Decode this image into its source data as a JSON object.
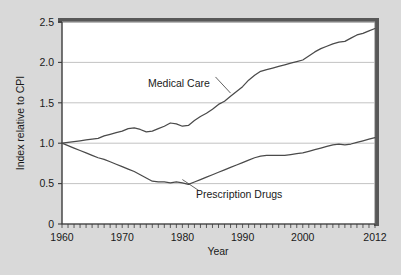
{
  "chart_data": {
    "type": "line",
    "title": "",
    "xlabel": "Year",
    "ylabel": "Index relative to CPI",
    "xlim": [
      1960,
      2012
    ],
    "ylim": [
      0,
      2.5
    ],
    "grid": true,
    "legend_position": "inline-annotations",
    "x_ticks": [
      1960,
      1970,
      1980,
      1990,
      2000,
      2012
    ],
    "x_tick_labels": [
      "1960",
      "1970",
      "1980",
      "1990",
      "2000",
      "2012"
    ],
    "x_minor_tick_interval": 1,
    "y_ticks": [
      0,
      0.5,
      1.0,
      1.5,
      2.0,
      2.5
    ],
    "y_tick_labels": [
      "0",
      "0.5",
      "1.0",
      "1.5",
      "2.0",
      "2.5"
    ],
    "x": [
      1960,
      1961,
      1962,
      1963,
      1964,
      1965,
      1966,
      1967,
      1968,
      1969,
      1970,
      1971,
      1972,
      1973,
      1974,
      1975,
      1976,
      1977,
      1978,
      1979,
      1980,
      1981,
      1982,
      1983,
      1984,
      1985,
      1986,
      1987,
      1988,
      1989,
      1990,
      1991,
      1992,
      1993,
      1994,
      1995,
      1996,
      1997,
      1998,
      1999,
      2000,
      2001,
      2002,
      2003,
      2004,
      2005,
      2006,
      2007,
      2008,
      2009,
      2010,
      2011,
      2012
    ],
    "series": [
      {
        "name": "Medical Care",
        "color": "#4a4a4a",
        "label_x": 1979,
        "label_y": 1.86,
        "values": [
          1.0,
          1.01,
          1.02,
          1.03,
          1.04,
          1.05,
          1.06,
          1.09,
          1.11,
          1.13,
          1.15,
          1.18,
          1.19,
          1.17,
          1.14,
          1.15,
          1.18,
          1.21,
          1.25,
          1.24,
          1.21,
          1.22,
          1.28,
          1.33,
          1.37,
          1.42,
          1.48,
          1.52,
          1.58,
          1.64,
          1.7,
          1.78,
          1.84,
          1.89,
          1.91,
          1.93,
          1.95,
          1.97,
          1.99,
          2.01,
          2.03,
          2.08,
          2.13,
          2.17,
          2.2,
          2.23,
          2.25,
          2.26,
          2.3,
          2.34,
          2.36,
          2.39,
          2.42
        ]
      },
      {
        "name": "Prescription Drugs",
        "color": "#4a4a4a",
        "label_x": 1983,
        "label_y": 0.4,
        "values": [
          1.0,
          0.97,
          0.94,
          0.91,
          0.88,
          0.85,
          0.82,
          0.8,
          0.77,
          0.74,
          0.71,
          0.68,
          0.65,
          0.61,
          0.57,
          0.53,
          0.52,
          0.52,
          0.51,
          0.52,
          0.51,
          0.49,
          0.52,
          0.55,
          0.58,
          0.61,
          0.64,
          0.67,
          0.7,
          0.73,
          0.76,
          0.79,
          0.82,
          0.84,
          0.85,
          0.85,
          0.85,
          0.85,
          0.86,
          0.87,
          0.88,
          0.9,
          0.92,
          0.94,
          0.96,
          0.98,
          0.99,
          0.98,
          0.99,
          1.01,
          1.03,
          1.05,
          1.07
        ]
      }
    ],
    "annotations": [
      {
        "text": "Medical Care",
        "leader_from_x": 1985.5,
        "leader_from_y": 1.82,
        "leader_to_x": 1988.0,
        "leader_to_y": 1.62
      },
      {
        "text": "Prescription Drugs",
        "leader_from_x": 1982.8,
        "leader_from_y": 0.41,
        "leader_to_x": 1980.0,
        "leader_to_y": 0.55
      }
    ]
  },
  "axes": {
    "y_title": "Index relative to CPI",
    "x_title": "Year"
  }
}
